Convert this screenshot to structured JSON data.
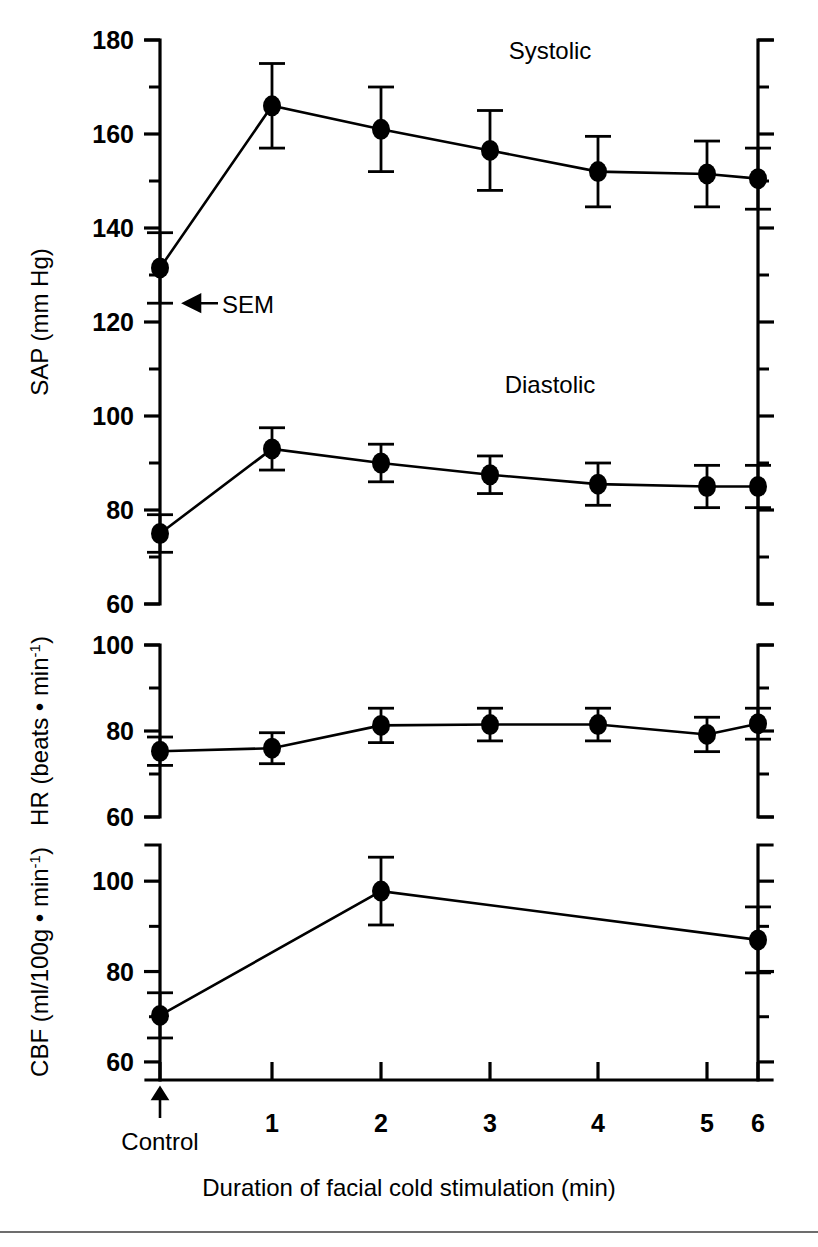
{
  "figure": {
    "background": "#ffffff",
    "ink_color": "#000000",
    "x_caption": "Duration of facial cold stimulation (min)",
    "control_label": "Control",
    "sem_label": "SEM",
    "footer_rule_color": "#6d6d6d"
  },
  "chart_data": {
    "type": "line",
    "title": "",
    "xlabel": "Duration of facial cold stimulation (min)",
    "x_categories": [
      "Control",
      "1",
      "2",
      "3",
      "4",
      "5",
      "6"
    ],
    "x_tick_labels": [
      "",
      "1",
      "2",
      "3",
      "4",
      "5",
      "6"
    ],
    "grid": false,
    "legend": "inline-annotation",
    "panels": [
      {
        "id": "sap",
        "ylabel": "SAP (mm Hg)",
        "ylabel_parts": {
          "prefix": "SAP (mm Hg)",
          "superscript": ""
        },
        "ylim": [
          60,
          180
        ],
        "ytick_labels": [
          "60",
          "80",
          "100",
          "120",
          "140",
          "160",
          "180"
        ],
        "ytick_values": [
          60,
          80,
          100,
          120,
          140,
          160,
          180
        ],
        "yminor_values": [
          70,
          90,
          110,
          130,
          150,
          170
        ],
        "annotations": [
          {
            "text": "Systolic",
            "x_category": "3",
            "y_value": 176
          },
          {
            "text": "Diastolic",
            "x_category": "3",
            "y_value": 105
          }
        ],
        "series": [
          {
            "name": "Systolic",
            "x": [
              "Control",
              "1",
              "2",
              "3",
              "4",
              "5",
              "6"
            ],
            "values": [
              131.5,
              166.0,
              161.0,
              156.5,
              152.0,
              151.5,
              150.5
            ],
            "errors": [
              7.5,
              9.0,
              9.0,
              8.5,
              7.5,
              7.0,
              6.5
            ]
          },
          {
            "name": "Diastolic",
            "x": [
              "Control",
              "1",
              "2",
              "3",
              "4",
              "5",
              "6"
            ],
            "values": [
              75.0,
              93.0,
              90.0,
              87.5,
              85.5,
              85.0,
              85.0
            ],
            "errors": [
              4.0,
              4.5,
              4.0,
              4.0,
              4.5,
              4.5,
              4.5
            ]
          }
        ]
      },
      {
        "id": "hr",
        "ylabel": "HR (beats • min-1)",
        "ylabel_parts": {
          "prefix": "HR (beats • min",
          "superscript": "-1",
          "suffix": ")"
        },
        "ylim": [
          60,
          100
        ],
        "ytick_labels": [
          "60",
          "80",
          "100"
        ],
        "ytick_values": [
          60,
          80,
          100
        ],
        "yminor_values": [
          70,
          90
        ],
        "annotations": [],
        "series": [
          {
            "name": "Heart rate",
            "x": [
              "Control",
              "1",
              "2",
              "3",
              "4",
              "5",
              "6"
            ],
            "values": [
              75.3,
              76.0,
              81.3,
              81.5,
              81.5,
              79.2,
              81.7
            ],
            "errors": [
              3.3,
              3.6,
              4.0,
              3.8,
              3.8,
              4.0,
              3.6
            ]
          }
        ]
      },
      {
        "id": "cbf",
        "ylabel": "CBF (ml/100g • min-1)",
        "ylabel_parts": {
          "prefix": "CBF (ml/100g • min",
          "superscript": "-1",
          "suffix": ")"
        },
        "ylim": [
          56,
          108
        ],
        "ytick_labels": [
          "60",
          "80",
          "100"
        ],
        "ytick_values": [
          60,
          80,
          100
        ],
        "yminor_values": [
          70,
          90
        ],
        "annotations": [],
        "series": [
          {
            "name": "Cerebral blood flow",
            "x": [
              "Control",
              "2",
              "6"
            ],
            "values": [
              70.3,
              97.8,
              87.0
            ],
            "errors": [
              5.0,
              7.5,
              7.3
            ]
          }
        ]
      }
    ]
  }
}
